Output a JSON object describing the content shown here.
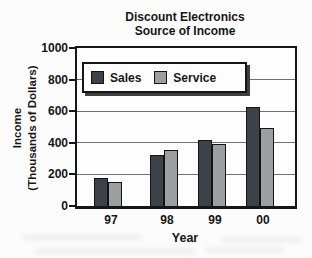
{
  "title": {
    "line1": "Discount Electronics",
    "line2": "Source of Income"
  },
  "y_axis": {
    "label_line1": "Income",
    "label_line2": "(Thousands of Dollars)",
    "ticks": [
      "1000",
      "800",
      "600",
      "400",
      "200",
      "0"
    ]
  },
  "x_axis": {
    "label": "Year",
    "categories": [
      "97",
      "98",
      "99",
      "00"
    ]
  },
  "legend": [
    {
      "label": "Sales",
      "color": "#3d4149"
    },
    {
      "label": "Service",
      "color": "#9c9ea1"
    }
  ],
  "colors": {
    "grid": "#6f6f6f",
    "axis": "#161616",
    "legend_shadow": "#3f3f3f"
  },
  "chart_data": {
    "type": "bar",
    "title": "Discount Electronics Source of Income",
    "categories": [
      "97",
      "98",
      "99",
      "00"
    ],
    "series": [
      {
        "name": "Sales",
        "color": "#3d4149",
        "values": [
          175,
          320,
          420,
          625
        ]
      },
      {
        "name": "Service",
        "color": "#9c9ea1",
        "values": [
          150,
          355,
          390,
          495
        ]
      }
    ],
    "xlabel": "Year",
    "ylabel": "Income (Thousands of Dollars)",
    "ylim": [
      0,
      1000
    ],
    "yticks": [
      1000,
      800,
      600,
      400,
      200,
      0
    ],
    "ytick_step": 200,
    "grid": true,
    "legend_position": "top-left-inside"
  }
}
